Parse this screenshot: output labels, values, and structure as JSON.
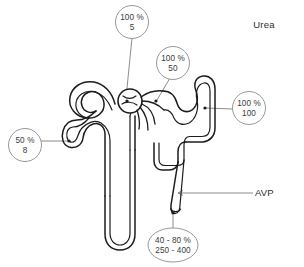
{
  "figure": {
    "title_label": "Urea",
    "hormone_label": "AVP",
    "background_color": "#ffffff",
    "line_color": "#1c1c1c",
    "bubble_stroke_color": "#8c8c8c",
    "text_color": "#3a3a3a"
  },
  "annotations": [
    {
      "id": "glomerulus",
      "shape": "circle",
      "percent": "100 %",
      "value": "5",
      "site": "glomerulus-bowman-capsule"
    },
    {
      "id": "proximal-end",
      "shape": "circle",
      "percent": "100 %",
      "value": "50",
      "site": "early-distal-tubule"
    },
    {
      "id": "distal-tubule",
      "shape": "circle",
      "percent": "100 %",
      "value": "100",
      "site": "distal-convoluted-tubule"
    },
    {
      "id": "loop-descending",
      "shape": "circle",
      "percent": "50 %",
      "value": "8",
      "site": "proximal-tubule-end"
    },
    {
      "id": "collecting-duct",
      "shape": "ellipse",
      "percent": "40 - 80 %",
      "value": "250 - 400",
      "site": "collecting-duct-outflow"
    }
  ]
}
